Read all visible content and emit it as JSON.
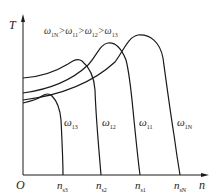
{
  "diagram": {
    "type": "torque-speed characteristic curves",
    "axes": {
      "y_label": "T",
      "x_label": "n",
      "origin_label": "O"
    },
    "condition": {
      "symbol": "ω",
      "parts": [
        {
          "sub": "1N"
        },
        {
          "sub": "11"
        },
        {
          "sub": "12"
        },
        {
          "sub": "13"
        }
      ],
      "separator": ">"
    },
    "curves": [
      {
        "name": "ω13",
        "label_main": "ω",
        "label_sub": "13",
        "sync_label_main": "n",
        "sync_label_sub": "s3"
      },
      {
        "name": "ω12",
        "label_main": "ω",
        "label_sub": "12",
        "sync_label_main": "n",
        "sync_label_sub": "s2"
      },
      {
        "name": "ω11",
        "label_main": "ω",
        "label_sub": "11",
        "sync_label_main": "n",
        "sync_label_sub": "s1"
      },
      {
        "name": "ω1N",
        "label_main": "ω",
        "label_sub": "1N",
        "sync_label_main": "n",
        "sync_label_sub": "sN"
      }
    ],
    "colors": {
      "line": "#1a1a1a",
      "text": "#222222"
    }
  }
}
